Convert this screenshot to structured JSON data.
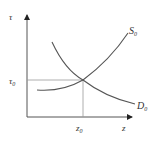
{
  "diagram": {
    "type": "supply-demand",
    "axes": {
      "y_label": "τ",
      "x_label": "z"
    },
    "equilibrium": {
      "y_label": "τ",
      "y_sub": "0",
      "x_label": "z",
      "x_sub": "0"
    },
    "curves": [
      {
        "name": "S",
        "sub": "0",
        "shape": "upward-sloping"
      },
      {
        "name": "D",
        "sub": "0",
        "shape": "downward-sloping"
      }
    ],
    "colors": {
      "line": "#444444",
      "dashed": "#888888",
      "text": "#333333"
    }
  }
}
